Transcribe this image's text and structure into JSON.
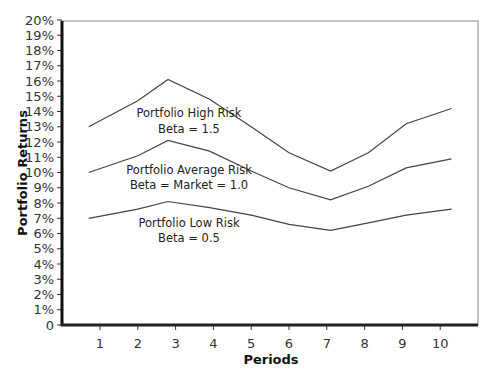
{
  "chart_data": {
    "type": "line",
    "title": "",
    "xlabel": "Periods",
    "ylabel": "Portfolio Returns",
    "x_ticks": [
      "1",
      "2",
      "3",
      "4",
      "5",
      "6",
      "7",
      "8",
      "9",
      "10"
    ],
    "y_ticks": [
      "0",
      "1%",
      "2%",
      "3%",
      "4%",
      "5%",
      "6%",
      "7%",
      "8%",
      "9%",
      "10%",
      "11%",
      "12%",
      "13%",
      "14%",
      "15%",
      "16%",
      "17%",
      "18%",
      "19%",
      "20%"
    ],
    "ylim": [
      0,
      20
    ],
    "xlim": [
      0,
      11
    ],
    "grid": false,
    "legend": "inline annotations",
    "x": [
      0.7,
      2.0,
      2.8,
      3.9,
      5.0,
      6.0,
      7.1,
      8.1,
      9.1,
      10.3
    ],
    "series": [
      {
        "name": "Portfolio High Risk",
        "annotation": [
          "Portfolio High Risk",
          "Beta = 1.5"
        ],
        "values": [
          13.0,
          14.7,
          16.1,
          14.8,
          13.0,
          11.3,
          10.1,
          11.3,
          13.2,
          14.2
        ]
      },
      {
        "name": "Portfolio Average Risk",
        "annotation": [
          "Portfolio Average Risk",
          "Beta = Market = 1.0"
        ],
        "values": [
          10.0,
          11.1,
          12.1,
          11.4,
          10.1,
          9.0,
          8.2,
          9.1,
          10.3,
          10.9
        ]
      },
      {
        "name": "Portfolio Low Risk",
        "annotation": [
          "Portfolio Low Risk",
          "Beta = 0.5"
        ],
        "values": [
          7.0,
          7.6,
          8.1,
          7.7,
          7.2,
          6.6,
          6.2,
          6.7,
          7.2,
          7.6
        ]
      }
    ]
  },
  "labels": {
    "xlabel": "Periods",
    "ylabel": "Portfolio Returns",
    "high_1": "Portfolio High Risk",
    "high_2": "Beta = 1.5",
    "avg_1": "Portfolio Average Risk",
    "avg_2": "Beta = Market = 1.0",
    "low_1": "Portfolio Low Risk",
    "low_2": "Beta = 0.5"
  }
}
